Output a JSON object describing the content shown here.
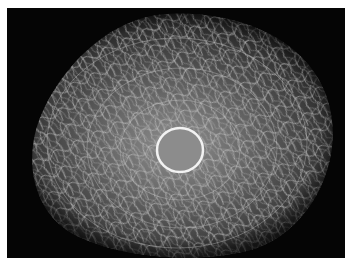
{
  "image": {
    "kind": "fluorescence micrograph",
    "subject": "cell with filamentous network surrounding a ring-shaped nucleus",
    "colors": {
      "background": "#050505",
      "cytoplasm_center": "#8a8a8a",
      "cytoplasm_edge": "#3a3a3a",
      "filament": "#c8c8c8",
      "nucleus_ring": "#f2f2f2",
      "nucleus_fill": "#8c8c8c",
      "border": "#ffffff"
    },
    "nucleus": {
      "cx": 173,
      "cy": 142,
      "rx": 23,
      "ry": 22
    }
  }
}
